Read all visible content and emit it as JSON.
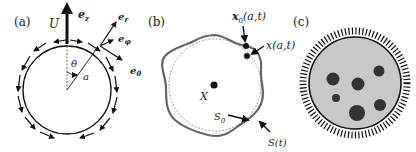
{
  "panels": {
    "a": {
      "label": "(a)",
      "velocity_label": "U",
      "ez_label": "e",
      "ez_sub": "z",
      "er_label": "e",
      "er_sub": "r",
      "ephi_label": "e",
      "ephi_sub": "φ",
      "etheta_label": "e",
      "etheta_sub": "θ",
      "theta_label": "θ",
      "radius_label": "a"
    },
    "b": {
      "label": "(b)",
      "x0_label": "x",
      "x0_sub": "0",
      "x0_args": "(a,t)",
      "x_label": "x(a,t)",
      "center_label": "X",
      "s0_label": "S",
      "s0_sub": "0",
      "st_label": "S(t)"
    },
    "c": {
      "label": "(c)"
    }
  },
  "colors": {
    "ink": "#111111",
    "deformed_surface": "#666666",
    "reference_surface": "#888888",
    "cell_fill": "#c8c8c8",
    "inclusion": "#333333"
  }
}
